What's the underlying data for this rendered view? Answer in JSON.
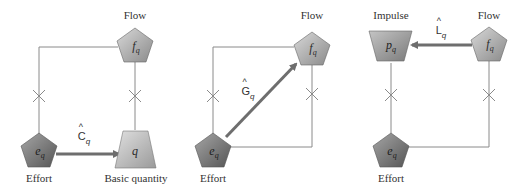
{
  "colors": {
    "line": "#8a8a8a",
    "arrow": "#6e6e6e",
    "effort_fill_light": "#9a9a9a",
    "effort_fill_dark": "#5e5e5e",
    "flow_fill_light": "#cfcfcf",
    "flow_fill_dark": "#8e8e8e",
    "quantity_fill_light": "#d6d6d6",
    "quantity_fill_dark": "#9c9c9c",
    "stroke": "#555555"
  },
  "panels": [
    {
      "id": "capacitance",
      "labels": {
        "top": "Flow",
        "bottom_left": "Effort",
        "bottom_right": "Basic quantity"
      },
      "nodes": {
        "flow": {
          "symbol": "f",
          "subscript": "q",
          "shape": "pentagon"
        },
        "effort": {
          "symbol": "e",
          "subscript": "q",
          "shape": "pentagon"
        },
        "quantity": {
          "symbol": "q",
          "subscript": "",
          "shape": "trapezoid"
        }
      },
      "operator": {
        "letter": "C",
        "hat": "^",
        "subscript": "q"
      },
      "arrow": {
        "from": "effort",
        "to": "quantity"
      }
    },
    {
      "id": "conductance",
      "labels": {
        "top": "Flow",
        "bottom_left": "Effort"
      },
      "nodes": {
        "flow": {
          "symbol": "f",
          "subscript": "q",
          "shape": "pentagon"
        },
        "effort": {
          "symbol": "e",
          "subscript": "q",
          "shape": "pentagon"
        }
      },
      "operator": {
        "letter": "G",
        "hat": "^",
        "subscript": "q"
      },
      "arrow": {
        "from": "effort",
        "to": "flow"
      }
    },
    {
      "id": "inductance",
      "labels": {
        "top_left": "Impulse",
        "top_right": "Flow",
        "bottom_left": "Effort"
      },
      "nodes": {
        "impulse": {
          "symbol": "p",
          "subscript": "q",
          "shape": "trapezoid"
        },
        "flow": {
          "symbol": "f",
          "subscript": "q",
          "shape": "pentagon"
        },
        "effort": {
          "symbol": "e",
          "subscript": "q",
          "shape": "pentagon"
        }
      },
      "operator": {
        "letter": "L",
        "hat": "^",
        "subscript": "q"
      },
      "arrow": {
        "from": "flow",
        "to": "impulse"
      }
    }
  ]
}
